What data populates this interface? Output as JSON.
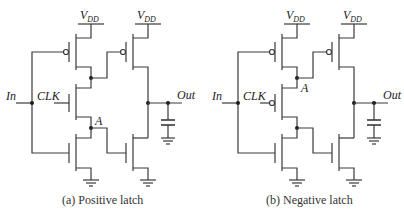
{
  "figure": {
    "panels": [
      {
        "id": "a",
        "caption": "(a) Positive latch",
        "labels": {
          "vdd_main": "V",
          "vdd_sub": "DD",
          "input": "In",
          "clock": "CLK",
          "node": "A",
          "output": "Out"
        },
        "clock_transistor": "nmos"
      },
      {
        "id": "b",
        "caption": "(b) Negative latch",
        "labels": {
          "vdd_main": "V",
          "vdd_sub": "DD",
          "input": "In",
          "clock": "CLK",
          "node": "A",
          "output": "Out"
        },
        "clock_transistor": "pmos"
      }
    ],
    "colors": {
      "wire": "#3a3a3a",
      "text": "#222222",
      "background": "#ffffff"
    }
  }
}
